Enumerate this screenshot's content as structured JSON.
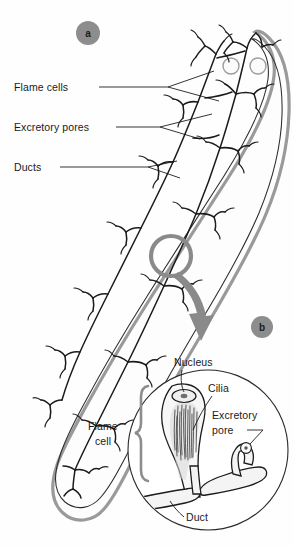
{
  "figure": {
    "background_color": "#fefefe",
    "ink_color": "#1b1b1b",
    "accent_gray": "#8a8a8a"
  },
  "panels": [
    {
      "id": "a",
      "letter": "a",
      "caption": "Whole flatworm with flame-cell network"
    },
    {
      "id": "b",
      "letter": "b",
      "caption": "Magnified flame cell and duct"
    }
  ],
  "panel_a": {
    "labels": [
      {
        "id": "flame-cells",
        "text": "Flame cells"
      },
      {
        "id": "excretory-pores",
        "text": "Excretory pores"
      },
      {
        "id": "ducts",
        "text": "Ducts"
      }
    ],
    "features": {
      "eyespot_count": 2,
      "body_outline_color": "#9a9a9a",
      "network_color": "#1b1b1b"
    }
  },
  "panel_b": {
    "labels": [
      {
        "id": "nucleus",
        "text": "Nucleus"
      },
      {
        "id": "cilia",
        "text": "Cilia"
      },
      {
        "id": "excretory-pore",
        "text": "Excretory",
        "text2": "pore"
      },
      {
        "id": "flame-cell",
        "text": "Flame",
        "text2": "cell"
      },
      {
        "id": "duct",
        "text": "Duct"
      }
    ],
    "brace_color": "#8d8d8d"
  },
  "icons": {
    "zoom_ring": "magnifier-ring-icon",
    "zoom_arrow": "curved-arrow-icon"
  }
}
